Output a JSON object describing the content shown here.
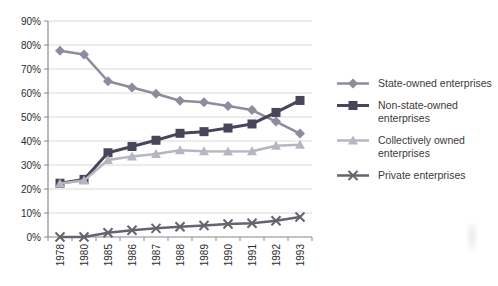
{
  "chart_data": {
    "type": "line",
    "title": "",
    "xlabel": "",
    "ylabel": "",
    "ylim": [
      0,
      90
    ],
    "y_tick_step": 10,
    "y_tick_labels": [
      "0%",
      "10%",
      "20%",
      "30%",
      "40%",
      "50%",
      "60%",
      "70%",
      "80%",
      "90%"
    ],
    "categories": [
      "1978",
      "1980",
      "1985",
      "1986",
      "1987",
      "1988",
      "1989",
      "1990",
      "1991",
      "1992",
      "1993"
    ],
    "grid": "horizontal",
    "legend_position": "right",
    "series": [
      {
        "name": "State-owned enterprises",
        "marker": "diamond",
        "color": "#8c8c9e",
        "values": [
          77.6,
          76.0,
          64.9,
          62.3,
          59.7,
          56.8,
          56.1,
          54.6,
          52.9,
          48.1,
          43.1
        ]
      },
      {
        "name": "Non-state-owned enterprises",
        "marker": "square",
        "color": "#46465a",
        "values": [
          22.4,
          24.0,
          35.1,
          37.7,
          40.3,
          43.2,
          43.9,
          45.4,
          47.1,
          51.9,
          56.9
        ]
      },
      {
        "name": "Collectively owned enterprises",
        "marker": "triangle",
        "color": "#b6b6c0",
        "values": [
          22.3,
          23.5,
          32.1,
          33.5,
          34.6,
          36.1,
          35.7,
          35.6,
          35.7,
          38.0,
          38.4
        ]
      },
      {
        "name": "Private enterprises",
        "marker": "x",
        "color": "#64646e",
        "values": [
          0.0,
          0.0,
          1.8,
          2.8,
          3.6,
          4.3,
          4.8,
          5.4,
          5.7,
          6.8,
          8.3
        ]
      }
    ],
    "colors": {
      "gridline": "#d9d9d9",
      "axis": "#8a8a8a",
      "tick_label": "#2b2b2b"
    }
  }
}
